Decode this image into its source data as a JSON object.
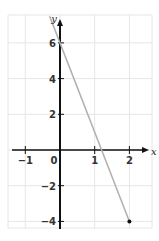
{
  "chart_data": {
    "type": "line",
    "title": "",
    "xlabel": "x",
    "ylabel": "y",
    "xlim": [
      -1.5,
      2.6
    ],
    "ylim": [
      -4.3,
      7.5
    ],
    "grid": true,
    "x_ticks": [
      -1,
      0,
      1,
      2
    ],
    "x_tick_labels": [
      "−1",
      "0",
      "1",
      "2"
    ],
    "y_ticks": [
      -4,
      -2,
      2,
      4,
      6
    ],
    "y_tick_labels": [
      "−4",
      "−2",
      "2",
      "4",
      "6"
    ],
    "series": [
      {
        "name": "y = -5x + 6",
        "x": [
          -0.3,
          2
        ],
        "y": [
          7.5,
          -4
        ],
        "color": "#b0b0b0",
        "endpoint_marker": {
          "x": 2,
          "y": -4
        }
      }
    ]
  },
  "colors": {
    "grid": "#e6e6e6",
    "axis": "#111111",
    "line": "#b0b0b0",
    "point": "#111111"
  }
}
